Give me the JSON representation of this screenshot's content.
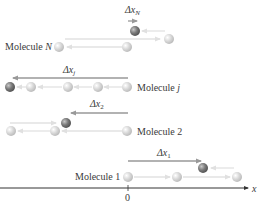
{
  "figure": {
    "axis": {
      "label": "x",
      "origin_label": "0"
    },
    "molecules": [
      {
        "id": "N",
        "label_prefix": "Molecule ",
        "label_index": "N",
        "displacement_label": "Δx",
        "displacement_sub": "N",
        "net_direction": "right"
      },
      {
        "id": "j",
        "label_prefix": "Molecule ",
        "label_index": "j",
        "displacement_label": "Δx",
        "displacement_sub": "j",
        "net_direction": "left"
      },
      {
        "id": "2",
        "label_prefix": "Molecule ",
        "label_index": "2",
        "displacement_label": "Δx",
        "displacement_sub": "2",
        "net_direction": "left"
      },
      {
        "id": "1",
        "label_prefix": "Molecule ",
        "label_index": "1",
        "displacement_label": "Δx",
        "displacement_sub": "1",
        "net_direction": "right"
      }
    ]
  },
  "colors": {
    "ball_light": "#d8d8d8",
    "ball_dark": "#7a7a7a",
    "path_arrow": "#e2e2e2",
    "displacement_arrow": "#9a9a9a",
    "axis": "#333333",
    "text": "#3a3a3a"
  }
}
